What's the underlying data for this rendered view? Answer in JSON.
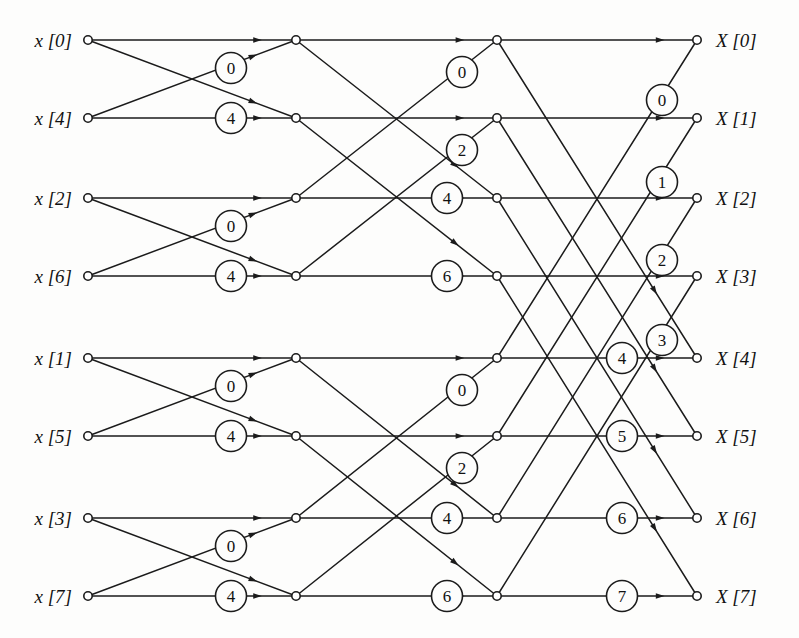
{
  "figure": {
    "top_caption_fragment": "",
    "width": 799,
    "height": 638,
    "background_color": "#fdfdfc",
    "line_color": "#1b1b1b"
  },
  "geometry": {
    "rows_y": [
      40,
      118,
      198,
      276,
      358,
      436,
      518,
      596
    ],
    "col_input_x": 88,
    "col_stage1_x": 296,
    "col_stage2_x": 497,
    "col_output_x": 697,
    "node_radius": 4.2,
    "coef_radius": 15.5
  },
  "inputs": {
    "label_x": 72,
    "items": [
      {
        "text": "x [0]",
        "var": "x",
        "index": "0",
        "row": 0
      },
      {
        "text": "x [4]",
        "var": "x",
        "index": "4",
        "row": 1
      },
      {
        "text": "x [2]",
        "var": "x",
        "index": "2",
        "row": 2
      },
      {
        "text": "x [6]",
        "var": "x",
        "index": "6",
        "row": 3
      },
      {
        "text": "x [1]",
        "var": "x",
        "index": "1",
        "row": 4
      },
      {
        "text": "x [5]",
        "var": "x",
        "index": "5",
        "row": 5
      },
      {
        "text": "x [3]",
        "var": "x",
        "index": "3",
        "row": 6
      },
      {
        "text": "x [7]",
        "var": "x",
        "index": "7",
        "row": 7
      }
    ]
  },
  "outputs": {
    "label_x": 716,
    "items": [
      {
        "text": "X [0]",
        "var": "X",
        "index": "0",
        "row": 0
      },
      {
        "text": "X [1]",
        "var": "X",
        "index": "1",
        "row": 1
      },
      {
        "text": "X [2]",
        "var": "X",
        "index": "2",
        "row": 2
      },
      {
        "text": "X [3]",
        "var": "X",
        "index": "3",
        "row": 3
      },
      {
        "text": "X [4]",
        "var": "X",
        "index": "4",
        "row": 4
      },
      {
        "text": "X [5]",
        "var": "X",
        "index": "5",
        "row": 5
      },
      {
        "text": "X [6]",
        "var": "X",
        "index": "6",
        "row": 6
      },
      {
        "text": "X [7]",
        "var": "X",
        "index": "7",
        "row": 7
      }
    ]
  },
  "stages": [
    {
      "name": "stage-1",
      "from_col": "col_input_x",
      "to_col": "col_stage1_x",
      "butterflies": [
        {
          "top_row": 0,
          "bottom_row": 1
        },
        {
          "top_row": 2,
          "bottom_row": 3
        },
        {
          "top_row": 4,
          "bottom_row": 5
        },
        {
          "top_row": 6,
          "bottom_row": 7
        }
      ],
      "coefficients": [
        {
          "label": "0",
          "x": 231,
          "y": 68,
          "row": 0
        },
        {
          "label": "4",
          "x": 231,
          "y": 118,
          "row": 1
        },
        {
          "label": "0",
          "x": 231,
          "y": 226,
          "row": 2
        },
        {
          "label": "4",
          "x": 231,
          "y": 276,
          "row": 3
        },
        {
          "label": "0",
          "x": 231,
          "y": 386,
          "row": 4
        },
        {
          "label": "4",
          "x": 231,
          "y": 436,
          "row": 5
        },
        {
          "label": "0",
          "x": 231,
          "y": 546,
          "row": 6
        },
        {
          "label": "4",
          "x": 231,
          "y": 596,
          "row": 7
        }
      ]
    },
    {
      "name": "stage-2",
      "from_col": "col_stage1_x",
      "to_col": "col_stage2_x",
      "butterflies": [
        {
          "top_row": 0,
          "bottom_row": 2
        },
        {
          "top_row": 1,
          "bottom_row": 3
        },
        {
          "top_row": 4,
          "bottom_row": 6
        },
        {
          "top_row": 5,
          "bottom_row": 7
        }
      ],
      "coefficients": [
        {
          "label": "0",
          "x": 462,
          "y": 72,
          "row": 0
        },
        {
          "label": "2",
          "x": 462,
          "y": 150,
          "row": 1
        },
        {
          "label": "4",
          "x": 447,
          "y": 198,
          "row": 2
        },
        {
          "label": "6",
          "x": 447,
          "y": 276,
          "row": 3
        },
        {
          "label": "0",
          "x": 462,
          "y": 390,
          "row": 4
        },
        {
          "label": "2",
          "x": 462,
          "y": 468,
          "row": 5
        },
        {
          "label": "4",
          "x": 447,
          "y": 518,
          "row": 6
        },
        {
          "label": "6",
          "x": 447,
          "y": 596,
          "row": 7
        }
      ]
    },
    {
      "name": "stage-3",
      "from_col": "col_stage2_x",
      "to_col": "col_output_x",
      "butterflies": [
        {
          "top_row": 0,
          "bottom_row": 4
        },
        {
          "top_row": 1,
          "bottom_row": 5
        },
        {
          "top_row": 2,
          "bottom_row": 6
        },
        {
          "top_row": 3,
          "bottom_row": 7
        }
      ],
      "coefficients": [
        {
          "label": "0",
          "x": 662,
          "y": 100,
          "row": 0
        },
        {
          "label": "1",
          "x": 662,
          "y": 182,
          "row": 1
        },
        {
          "label": "2",
          "x": 662,
          "y": 260,
          "row": 2
        },
        {
          "label": "3",
          "x": 662,
          "y": 340,
          "row": 3
        },
        {
          "label": "4",
          "x": 622,
          "y": 358,
          "row": 4
        },
        {
          "label": "5",
          "x": 622,
          "y": 436,
          "row": 5
        },
        {
          "label": "6",
          "x": 622,
          "y": 518,
          "row": 6
        },
        {
          "label": "7",
          "x": 622,
          "y": 596,
          "row": 7
        }
      ]
    }
  ],
  "chart_data": {
    "type": "diagram",
    "node_count": 32,
    "stage_count": 3,
    "input_order": [
      "x[0]",
      "x[4]",
      "x[2]",
      "x[6]",
      "x[1]",
      "x[5]",
      "x[3]",
      "x[7]"
    ],
    "output_order": [
      "X[0]",
      "X[1]",
      "X[2]",
      "X[3]",
      "X[4]",
      "X[5]",
      "X[6]",
      "X[7]"
    ],
    "twiddle_exponents_by_stage": [
      [
        "0",
        "4",
        "0",
        "4",
        "0",
        "4",
        "0",
        "4"
      ],
      [
        "0",
        "2",
        "4",
        "6",
        "0",
        "2",
        "4",
        "6"
      ],
      [
        "0",
        "1",
        "2",
        "3",
        "4",
        "5",
        "6",
        "7"
      ]
    ]
  }
}
